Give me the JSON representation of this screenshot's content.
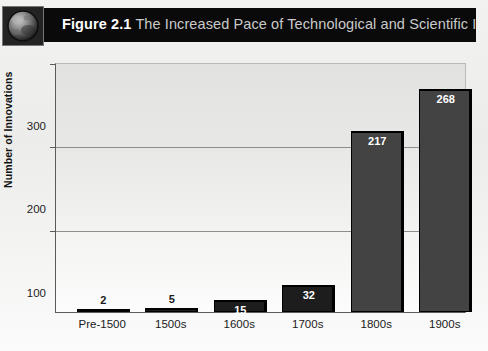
{
  "header": {
    "figure_number": "Figure 2.1",
    "title": "The Increased Pace of Technological and Scientific Innovation",
    "icon": "globe-icon",
    "band_color": "#0a0a0a"
  },
  "colors": {
    "band": "#0a0a0a",
    "bar_small": "#1d1d1d",
    "bar_tall": "#434343",
    "bar_edge": "#000000",
    "plot_bg": "#e8e8e6",
    "gridline": "#8d8d8d",
    "axis": "#5b5b5b",
    "label_light": "#ffffff",
    "label_dark": "#1a1a1a"
  },
  "chart_data": {
    "type": "bar",
    "title": "The Increased Pace of Technological and Scientific Innovation",
    "categories": [
      "Pre-1500",
      "1500s",
      "1600s",
      "1700s",
      "1800s",
      "1900s"
    ],
    "values": [
      2,
      5,
      15,
      32,
      217,
      268
    ],
    "xlabel": "",
    "ylabel": "Number of Innovations",
    "ylim": [
      0,
      300
    ],
    "yticks": [
      100,
      200,
      300
    ],
    "ytick_labels": [
      "100",
      "200",
      "300"
    ],
    "grid": true,
    "legend": "none",
    "label_placement": [
      "above",
      "above",
      "inside",
      "inside",
      "inside",
      "inside"
    ]
  }
}
